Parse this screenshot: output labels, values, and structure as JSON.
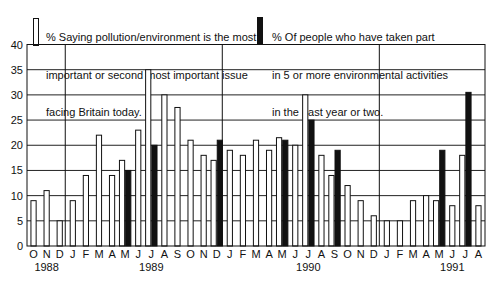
{
  "chart_data": {
    "type": "bar",
    "title": "",
    "xlabel": "",
    "ylabel": "",
    "ylim": [
      0,
      40
    ],
    "yticks": [
      0,
      5,
      10,
      15,
      20,
      25,
      30,
      35,
      40
    ],
    "grid": true,
    "legend_position": "top",
    "categories": [
      "O",
      "N",
      "D",
      "J",
      "F",
      "M",
      "A",
      "M",
      "J",
      "J",
      "A",
      "S",
      "O",
      "N",
      "D",
      "J",
      "F",
      "M",
      "A",
      "M",
      "J",
      "J",
      "A",
      "S",
      "O",
      "N",
      "D",
      "J",
      "F",
      "M",
      "A",
      "M",
      "J",
      "J",
      "A"
    ],
    "year_labels": [
      {
        "label": "1988",
        "month_index": 1
      },
      {
        "label": "1989",
        "month_index": 9
      },
      {
        "label": "1990",
        "month_index": 21
      },
      {
        "label": "1991",
        "month_index": 32
      }
    ],
    "year_separators_after_index": [
      2,
      14,
      26
    ],
    "series": [
      {
        "name": "% Saying pollution/environment is the most important or second most important issue facing Britain today.",
        "style": "white",
        "values": [
          9,
          11,
          5,
          9,
          14,
          22,
          14,
          17,
          23,
          35,
          30,
          27.5,
          21,
          18,
          17,
          19,
          18,
          21,
          19,
          21.5,
          20,
          30,
          18,
          14,
          12,
          9,
          6,
          5,
          5,
          9,
          10,
          9,
          8,
          18,
          8
        ]
      },
      {
        "name": "% Of people who have taken part in 5 or more environmental activities in the past year or two.",
        "style": "black",
        "values": [
          null,
          null,
          null,
          null,
          null,
          null,
          null,
          15,
          null,
          20,
          null,
          null,
          null,
          null,
          21,
          null,
          null,
          null,
          null,
          21,
          null,
          25,
          null,
          19,
          null,
          null,
          null,
          null,
          null,
          null,
          null,
          19,
          null,
          30.5,
          null
        ]
      }
    ]
  },
  "legend": {
    "white_label_lines": [
      "% Saying pollution/environment is the most",
      "important or second most important issue",
      "facing Britain today."
    ],
    "black_label_lines": [
      "% Of people who have taken part",
      "in 5 or more environmental activities",
      "in the past year or two."
    ]
  },
  "colors": {
    "white_bar": "#ffffff",
    "black_bar": "#111111",
    "grid": "#222222"
  }
}
